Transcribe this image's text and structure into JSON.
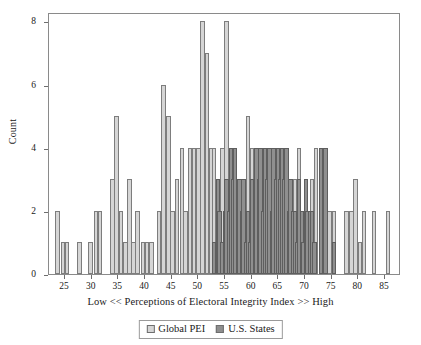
{
  "chart_data": {
    "type": "bar",
    "title": "",
    "subtitle": "",
    "xlabel": "Low << Perceptions of Electoral Integrity Index >> High",
    "ylabel": "Count",
    "xlim": [
      22,
      88
    ],
    "ylim": [
      0,
      8.3
    ],
    "xticks": [
      25,
      30,
      35,
      40,
      45,
      50,
      55,
      60,
      65,
      70,
      75,
      80,
      85
    ],
    "yticks": [
      0,
      2,
      4,
      6,
      8
    ],
    "grid": false,
    "legend_position": "bottom-center",
    "bin_width": 0.85,
    "colors": {
      "global_pei": "#d5d5d5",
      "us_states": "#8f8f8f",
      "bar_outline": "#7d7d7d",
      "axis": "#8a8a8a",
      "text": "#1a1a1a"
    },
    "series": [
      {
        "name": "Global PEI",
        "x": [
          23.6,
          24.6,
          25.4,
          27.7,
          29.8,
          30.8,
          31.6,
          33.9,
          34.7,
          35.5,
          36.3,
          37.1,
          37.8,
          38.6,
          39.6,
          40.4,
          41.2,
          42.6,
          43.5,
          44.4,
          45.2,
          46.0,
          46.9,
          47.6,
          48.4,
          49.2,
          50.0,
          50.8,
          51.6,
          52.4,
          52.9,
          53.7,
          54.5,
          55.3,
          56.1,
          56.9,
          57.7,
          58.5,
          59.3,
          60.1,
          60.9,
          61.7,
          62.5,
          63.3,
          64.1,
          64.9,
          65.7,
          66.5,
          67.3,
          68.1,
          68.9,
          69.7,
          70.5,
          71.3,
          72.1,
          73.0,
          73.8,
          74.6,
          75.4,
          77.8,
          78.7,
          79.5,
          80.3,
          81.1,
          82.9,
          85.6
        ],
        "values": [
          2,
          1,
          1,
          1,
          1,
          2,
          2,
          3,
          5,
          2,
          1,
          3,
          1,
          2,
          1,
          1,
          1,
          2,
          6,
          5,
          2,
          3,
          4,
          2,
          4,
          4,
          4,
          8,
          7,
          4,
          4,
          2,
          4,
          8,
          4,
          3,
          3,
          3,
          5,
          4,
          4,
          3,
          4,
          4,
          4,
          3,
          3,
          2,
          2,
          3,
          4,
          2,
          2,
          3,
          4,
          4,
          4,
          2,
          2,
          2,
          2,
          3,
          1,
          2,
          2,
          2
        ]
      },
      {
        "name": "U.S. States",
        "x": [
          52.9,
          53.7,
          54.0,
          54.5,
          55.0,
          55.3,
          55.8,
          56.1,
          56.6,
          56.9,
          57.4,
          57.7,
          58.2,
          58.5,
          59.0,
          59.3,
          59.8,
          60.1,
          60.6,
          60.9,
          61.4,
          61.7,
          62.2,
          62.5,
          63.0,
          63.3,
          63.8,
          64.1,
          64.6,
          64.9,
          65.4,
          65.7,
          66.2,
          66.5,
          67.0,
          67.3,
          67.8,
          68.1,
          68.6,
          68.9,
          69.4,
          69.7,
          70.2,
          70.5,
          71.0,
          71.3,
          71.8,
          73.0,
          73.8,
          75.4
        ],
        "values": [
          1,
          3,
          2,
          1,
          2,
          3,
          2,
          4,
          3,
          4,
          2,
          3,
          2,
          3,
          1,
          2,
          1,
          3,
          2,
          4,
          3,
          4,
          2,
          4,
          3,
          4,
          2,
          4,
          3,
          4,
          3,
          4,
          3,
          4,
          2,
          3,
          2,
          2,
          1,
          3,
          2,
          1,
          3,
          2,
          2,
          2,
          1,
          4,
          4,
          1
        ]
      }
    ],
    "legend": [
      {
        "label": "Global PEI",
        "swatch": "global"
      },
      {
        "label": "U.S. States",
        "swatch": "states"
      }
    ]
  }
}
